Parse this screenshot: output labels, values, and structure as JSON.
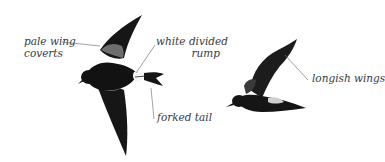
{
  "figure": {
    "colors": {
      "background": "#ffffff",
      "bird_dark": "#141414",
      "bird_mid": "#2e2e2e",
      "wing_covert_pale": "#8a8a8a",
      "rump_white": "#f2f2f2",
      "leader_line": "#7a7a7a",
      "label_text": "#3a3a3a"
    },
    "birds": [
      {
        "id": "bird-top-view",
        "view": "from above, wings spread",
        "annotations": [
          {
            "id": "pale-wing-coverts",
            "lines": [
              "pale wing",
              "coverts"
            ]
          },
          {
            "id": "white-divided-rump",
            "lines": [
              "white divided",
              "rump"
            ]
          },
          {
            "id": "forked-tail",
            "lines": [
              "forked tail"
            ]
          }
        ]
      },
      {
        "id": "bird-side-view",
        "view": "side profile, wings raised",
        "annotations": [
          {
            "id": "longish-wings",
            "lines": [
              "longish wings"
            ]
          }
        ]
      }
    ]
  }
}
